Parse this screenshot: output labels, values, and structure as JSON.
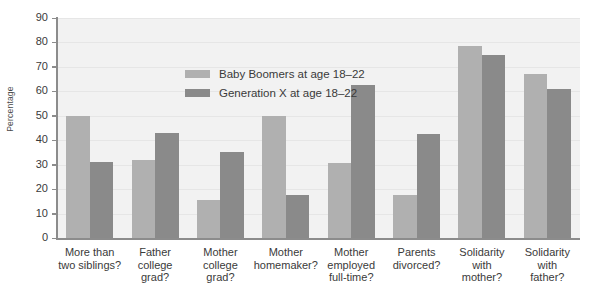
{
  "chart_data": {
    "type": "bar",
    "title": "",
    "xlabel": "",
    "ylabel": "Percentage",
    "ylim": [
      0,
      90
    ],
    "ytick_step": 10,
    "yticks": [
      0,
      10,
      20,
      30,
      40,
      50,
      60,
      70,
      80,
      90
    ],
    "grid": true,
    "legend_position": "upper-left-inside",
    "categories": [
      "More than\ntwo siblings?",
      "Father\ncollege\ngrad?",
      "Mother\ncollege\ngrad?",
      "Mother\nhomemaker?",
      "Mother\nemployed\nfull-time?",
      "Parents\ndivorced?",
      "Solidarity\nwith\nmother?",
      "Solidarity\nwith\nfather?"
    ],
    "series": [
      {
        "name": "Baby Boomers at age 18–22",
        "color": "#b0b0b0",
        "values": [
          50,
          32,
          15.5,
          50,
          30.5,
          17.5,
          78.5,
          67
        ]
      },
      {
        "name": "Generation X at age 18–22",
        "color": "#8a8a8a",
        "values": [
          31,
          43,
          35,
          17.5,
          62.5,
          42.5,
          75,
          61
        ]
      }
    ]
  },
  "colors": {
    "plot_background": "#f2f2f2",
    "gridline": "#e6e6e6",
    "axis": "#8c8c8c",
    "text": "#3a3a3a",
    "series_0": "#b0b0b0",
    "series_1": "#8a8a8a"
  }
}
